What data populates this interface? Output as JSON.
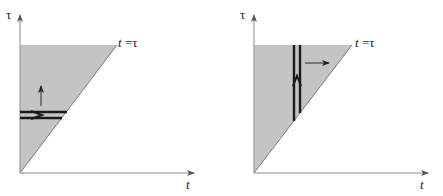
{
  "figure": {
    "panels": [
      {
        "id": "left",
        "y_axis_label": "τ",
        "x_axis_label": "t",
        "diagonal_label_t": "t",
        "diagonal_label_eq": " =τ",
        "shaded_region": "0 ≤ t ≤ τ (triangle above diagonal t = τ)",
        "strip": "horizontal",
        "strip_arrow": "right",
        "sweep_arrow": "up"
      },
      {
        "id": "right",
        "y_axis_label": "τ",
        "x_axis_label": "t",
        "diagonal_label_t": "t",
        "diagonal_label_eq": " =τ",
        "shaded_region": "0 ≤ t ≤ τ (triangle above diagonal t = τ)",
        "strip": "vertical",
        "strip_arrow": "up",
        "sweep_arrow": "right"
      }
    ],
    "colors": {
      "shade": "#c4c4c4",
      "axis": "#8a8a8a",
      "strip": "#1a1a1a"
    }
  }
}
